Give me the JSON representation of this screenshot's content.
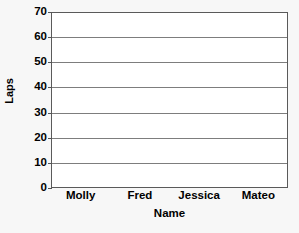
{
  "chart_data": {
    "type": "bar",
    "title": "",
    "xlabel": "Name",
    "ylabel": "Laps",
    "categories": [
      "Molly",
      "Fred",
      "Jessica",
      "Mateo"
    ],
    "values": [
      0,
      0,
      0,
      0
    ],
    "ylim": [
      0,
      70
    ],
    "y_ticks": [
      0,
      10,
      20,
      30,
      40,
      50,
      60,
      70
    ],
    "y_tick_labels": [
      "0",
      "10",
      "20",
      "30",
      "40",
      "50",
      "60",
      "70"
    ],
    "grid": "horizontal",
    "legend": "none",
    "series": [
      {
        "name": "Laps",
        "values": [
          0,
          0,
          0,
          0
        ]
      }
    ]
  },
  "axes": {
    "y_title": "Laps",
    "x_title": "Name"
  },
  "colors": {
    "background": "#f7f7f7",
    "plot_background": "#ffffff",
    "gridline": "#7d7d7d",
    "frame": "#5a5a5a",
    "text": "#000000"
  }
}
